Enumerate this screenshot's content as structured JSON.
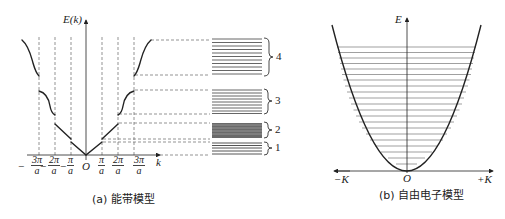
{
  "figure_a": {
    "caption": "(a) 能带模型",
    "y_axis_label": "E(k)",
    "x_axis_label": "k",
    "origin_label": "O",
    "ticks": [
      {
        "sign": "−",
        "num": "3π",
        "den": "a"
      },
      {
        "sign": "−",
        "num": "2π",
        "den": "a"
      },
      {
        "sign": "−",
        "num": "π",
        "den": "a"
      },
      {
        "sign": "",
        "num": "π",
        "den": "a"
      },
      {
        "sign": "",
        "num": "2π",
        "den": "a"
      },
      {
        "sign": "",
        "num": "3π",
        "den": "a"
      }
    ],
    "bands": [
      {
        "index": "1",
        "label": "1"
      },
      {
        "index": "2",
        "label": "2"
      },
      {
        "index": "3",
        "label": "3"
      },
      {
        "index": "4",
        "label": "4"
      }
    ]
  },
  "figure_b": {
    "caption": "(b) 自由电子模型",
    "y_axis_label": "E",
    "origin_label": "O",
    "x_left_label": "−K",
    "x_right_label": "+K"
  },
  "colors": {
    "line": "#222222",
    "dash": "#666666",
    "level": "#555555"
  }
}
